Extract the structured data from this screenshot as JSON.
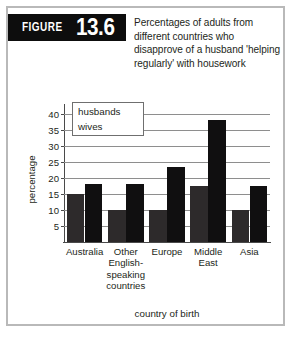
{
  "figure": {
    "banner_word": "FIGURE",
    "banner_number": "13.6",
    "banner_color": "#0d0d0d",
    "title": "Percentages of adults from different countries who disapprove of a husband 'helping regularly' with housework",
    "frame_color": "#b9b9b9"
  },
  "chart_data": {
    "type": "bar",
    "title": "Percentages of adults from different countries who disapprove of a husband 'helping regularly' with housework",
    "categories": [
      "Australia",
      "Other English-speaking countries",
      "Europe",
      "Middle East",
      "Asia"
    ],
    "category_lines": [
      [
        "Australia"
      ],
      [
        "Other",
        "English-",
        "speaking",
        "countries"
      ],
      [
        "Europe"
      ],
      [
        "Middle",
        "East"
      ],
      [
        "Asia"
      ]
    ],
    "series": [
      {
        "name": "husbands",
        "color": "#2d2a2b",
        "values": [
          15,
          10,
          10,
          17.5,
          10
        ]
      },
      {
        "name": "wives",
        "color": "#100f10",
        "values": [
          18,
          18,
          23.5,
          38,
          17.5
        ]
      }
    ],
    "xlabel": "country of birth",
    "ylabel": "percentage",
    "ylim": [
      0,
      42.5
    ],
    "yticks": [
      5,
      10,
      15,
      20,
      25,
      30,
      35,
      40
    ],
    "ytick_labels": [
      "5",
      "10",
      "15",
      "20",
      "25",
      "30",
      "35",
      "40"
    ],
    "grid": true,
    "grid_color": "#8e8e8e",
    "legend_position": "top-left",
    "legend_entries": [
      "husbands",
      "wives"
    ]
  }
}
